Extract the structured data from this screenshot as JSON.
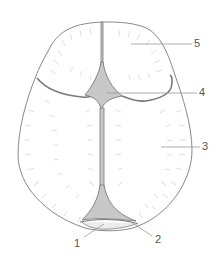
{
  "diagram": {
    "labels": [
      {
        "id": "1",
        "text": "1",
        "x": 74,
        "y": 238
      },
      {
        "id": "2",
        "text": "2",
        "x": 155,
        "y": 234
      },
      {
        "id": "3",
        "text": "3",
        "x": 202,
        "y": 141
      },
      {
        "id": "4",
        "text": "4",
        "x": 199,
        "y": 87
      },
      {
        "id": "5",
        "text": "5",
        "x": 194,
        "y": 38
      }
    ],
    "colors": {
      "outline": "#7a7a7a",
      "fontanelle_fill": "#c8c8c8",
      "hatching": "#d4d4d4",
      "leader": "#9a9a9a",
      "label": "#555555"
    }
  }
}
